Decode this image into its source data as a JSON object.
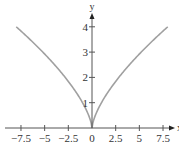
{
  "chart_data": {
    "type": "line",
    "title": "",
    "xlabel": "x",
    "ylabel": "y",
    "function": "y = |x|^(2/3)",
    "xlim": [
      -8.1,
      8.6
    ],
    "ylim": [
      0,
      4.4
    ],
    "grid": false,
    "legend": null,
    "x_ticks": [
      -7.5,
      -5,
      -2.5,
      0,
      2.5,
      5,
      7.5
    ],
    "x_tick_labels": [
      "−7.5",
      "−5",
      "−2.5",
      "0",
      "2.5",
      "5",
      "7.5"
    ],
    "y_ticks": [
      1,
      2,
      3,
      4
    ],
    "y_tick_labels": [
      "1",
      "2",
      "3",
      "4"
    ],
    "series": [
      {
        "name": "y = |x|^(2/3)",
        "color": "#a0a0a0",
        "x": [
          -8,
          -7,
          -6,
          -5,
          -4,
          -3,
          -2,
          -1,
          -0.5,
          -0.1,
          0,
          0.1,
          0.5,
          1,
          2,
          3,
          4,
          5,
          6,
          7,
          8
        ],
        "y": [
          4.0,
          3.66,
          3.3,
          2.92,
          2.52,
          2.08,
          1.59,
          1.0,
          0.63,
          0.22,
          0,
          0.22,
          0.63,
          1.0,
          1.59,
          2.08,
          2.52,
          2.92,
          3.3,
          3.66,
          4.0
        ]
      }
    ],
    "colors": {
      "axis": "#555555",
      "curve": "#a0a0a0",
      "text": "#333333"
    }
  }
}
